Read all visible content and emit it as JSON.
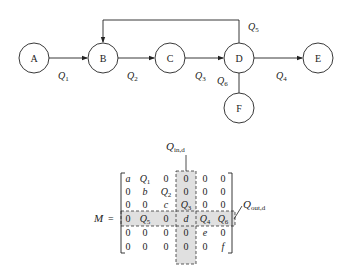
{
  "graph": {
    "nodes": [
      {
        "id": "A",
        "label": "A",
        "cx": 34,
        "cy": 58
      },
      {
        "id": "B",
        "label": "B",
        "cx": 103,
        "cy": 58
      },
      {
        "id": "C",
        "label": "C",
        "cx": 170,
        "cy": 58
      },
      {
        "id": "D",
        "label": "D",
        "cx": 239,
        "cy": 58
      },
      {
        "id": "E",
        "label": "E",
        "cx": 318,
        "cy": 58
      },
      {
        "id": "F",
        "label": "F",
        "cx": 239,
        "cy": 108
      }
    ],
    "edges": [
      {
        "from": "A",
        "to": "B",
        "label": "Q",
        "sub": "1"
      },
      {
        "from": "B",
        "to": "C",
        "label": "Q",
        "sub": "2"
      },
      {
        "from": "C",
        "to": "D",
        "label": "Q",
        "sub": "3"
      },
      {
        "from": "D",
        "to": "E",
        "label": "Q",
        "sub": "4"
      },
      {
        "from": "D",
        "to": "B",
        "label": "Q",
        "sub": "5",
        "style": "loop-over-top"
      },
      {
        "from": "D",
        "to": "F",
        "label": "Q",
        "sub": "6"
      }
    ]
  },
  "matrix": {
    "name": "M",
    "equals": "=",
    "in_label": {
      "main": "Q",
      "sub": "in,d"
    },
    "out_label": {
      "main": "Q",
      "sub": "out,d"
    },
    "rows": [
      [
        "a",
        "Q1",
        "0",
        "0",
        "0",
        "0"
      ],
      [
        "0",
        "b",
        "Q2",
        "0",
        "0",
        "0"
      ],
      [
        "0",
        "0",
        "c",
        "Q3",
        "0",
        "0"
      ],
      [
        "0",
        "Q5",
        "0",
        "d",
        "Q4",
        "Q6"
      ],
      [
        "0",
        "0",
        "0",
        "0",
        "e",
        "0"
      ],
      [
        "0",
        "0",
        "0",
        "0",
        "0",
        "f"
      ]
    ],
    "highlight_color": "#e0e0e0"
  }
}
